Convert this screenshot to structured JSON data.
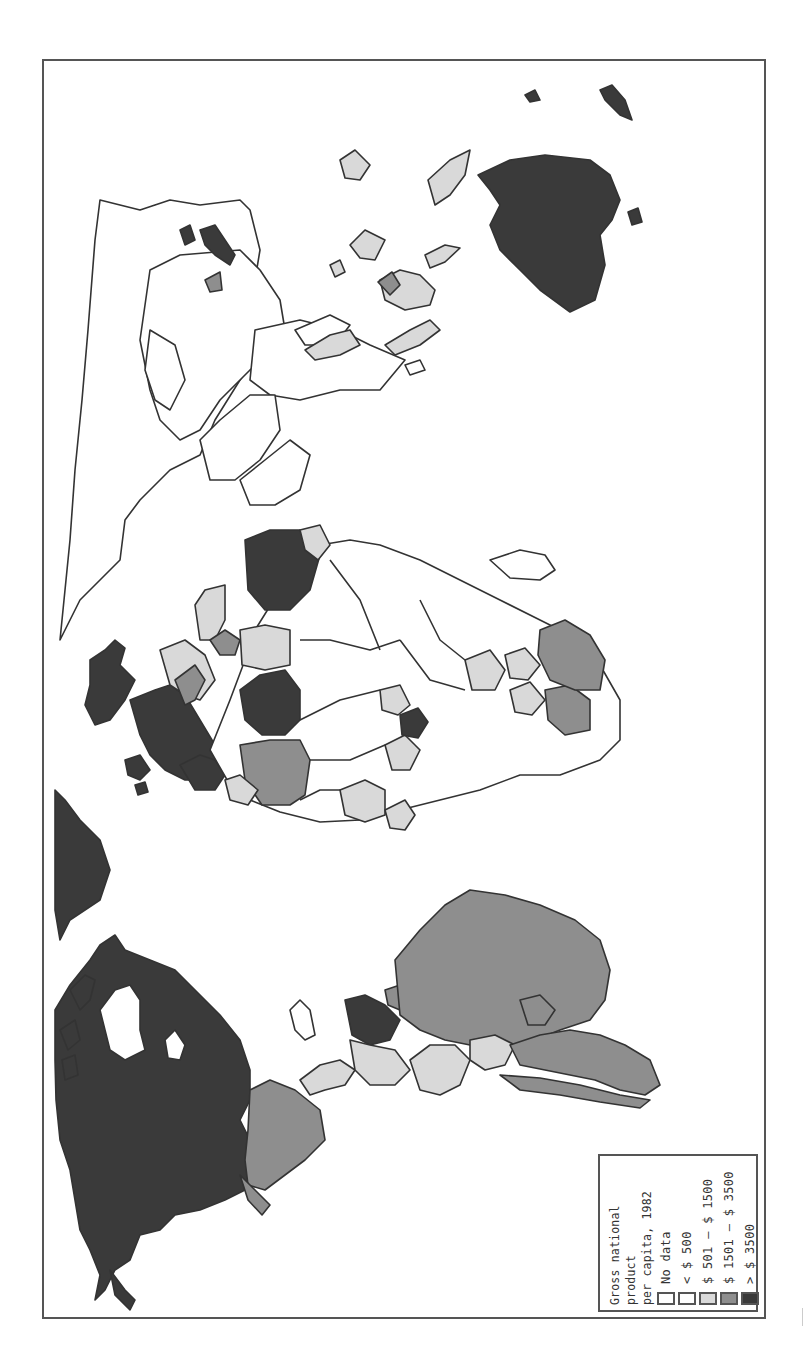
{
  "map": {
    "orientation": "rotated 90° clockwise (north points left)",
    "subject": "World map shaded by gross national product per capita, 1982"
  },
  "legend": {
    "title_line1": "Gross national product",
    "title_line2": "per capita, 1982",
    "items": [
      {
        "label": "No data",
        "color": "#ffffff"
      },
      {
        "label": "< $ 500",
        "color": "#ffffff"
      },
      {
        "label": "$ 501 – $ 1500",
        "color": "#d9d9d9"
      },
      {
        "label": "$ 1501 – $ 3500",
        "color": "#8e8e8e"
      },
      {
        "label": "> $ 3500",
        "color": "#3a3a3a"
      }
    ]
  },
  "colors": {
    "frame": "#555555",
    "outline": "#333333",
    "no_data": "#ffffff",
    "low": "#ffffff",
    "lower_middle": "#d9d9d9",
    "upper_middle": "#8e8e8e",
    "high": "#3a3a3a"
  },
  "regions": [
    {
      "name": "North America (USA/Canada)",
      "class": "> $ 3500"
    },
    {
      "name": "Greenland",
      "class": "> $ 3500"
    },
    {
      "name": "Mexico",
      "class": "$ 1501 – $ 3500"
    },
    {
      "name": "Central America",
      "class": "$ 501 – $ 1500"
    },
    {
      "name": "Venezuela",
      "class": "> $ 3500"
    },
    {
      "name": "Brazil",
      "class": "$ 1501 – $ 3500"
    },
    {
      "name": "Argentina",
      "class": "$ 1501 – $ 3500"
    },
    {
      "name": "Colombia / Peru / Bolivia",
      "class": "$ 501 – $ 1500"
    },
    {
      "name": "Western Europe",
      "class": "> $ 3500"
    },
    {
      "name": "Libya",
      "class": "> $ 3500"
    },
    {
      "name": "Saudi Arabia",
      "class": "> $ 3500"
    },
    {
      "name": "Algeria",
      "class": "$ 1501 – $ 3500"
    },
    {
      "name": "Gabon",
      "class": "> $ 3500"
    },
    {
      "name": "South Africa",
      "class": "$ 1501 – $ 3500"
    },
    {
      "name": "Russia / China / India",
      "class": "< $ 500"
    },
    {
      "name": "Australia",
      "class": "> $ 3500"
    },
    {
      "name": "Japan",
      "class": "> $ 3500"
    },
    {
      "name": "Indonesia / Philippines",
      "class": "$ 501 – $ 1500"
    }
  ]
}
